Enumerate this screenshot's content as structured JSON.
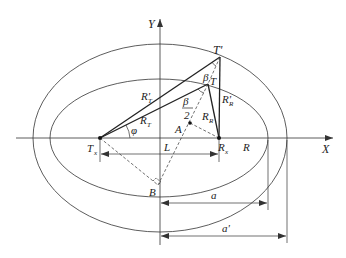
{
  "diagram": {
    "colors": {
      "line": "#333333",
      "text": "#222222",
      "background": "#ffffff"
    },
    "axes": {
      "x_label": "X",
      "y_label": "Y"
    },
    "points": {
      "Tx": "T",
      "Tx_sub": "x",
      "Rx": "R",
      "Rx_sub": "x",
      "T": "T",
      "T_prime": "T'",
      "A": "A",
      "B": "B"
    },
    "labels": {
      "R_T": "R",
      "R_T_sub": "T",
      "R_T_prime": "R'",
      "R_T_prime_sub": "T",
      "R_R": "R",
      "R_R_sub": "R",
      "R_R_prime": "R'",
      "R_R_prime_sub": "R",
      "phi": "φ",
      "beta": "β",
      "beta_half_num": "β",
      "beta_half_den": "2",
      "L": "L",
      "R": "R",
      "a": "a",
      "a_prime": "a'"
    }
  }
}
